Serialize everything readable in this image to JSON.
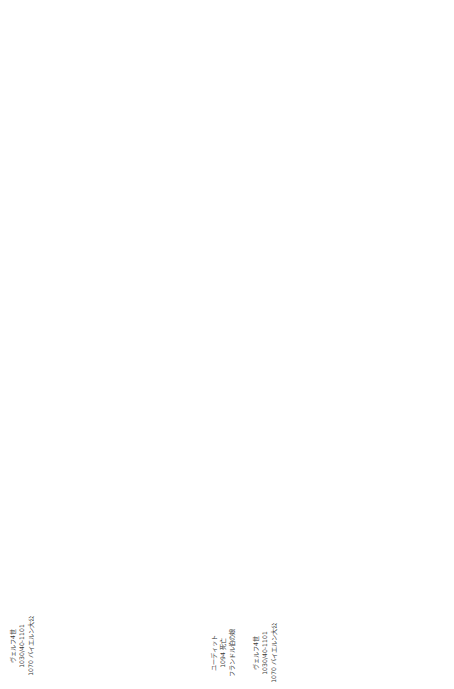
{
  "chart": {
    "title": "",
    "markers": {
      "one": "①",
      "two": "②",
      "three": "③"
    },
    "marriage_labels": {
      "first": "第一の結婚",
      "second": "第二の結婚"
    },
    "people": {
      "welf4": [
        "ヴェルフ4世",
        "1030/40-1101",
        "1070 バイエルン大公"
      ],
      "judith_fl": [
        "ユーディット",
        "1094 死亡",
        "フランドル伯の娘"
      ],
      "welf5": [
        "ヴェルフ5世",
        "ca.1073-1120",
        "1101 バイエルン大公"
      ],
      "mathilde_t": [
        "マティルデ",
        "1089 結婚、1095 離婚",
        "トスカーナ伯の娘"
      ],
      "heinrich_black": [
        "ハインリヒ黒公",
        "ca.1074-1126",
        "1120 バイエルン大公"
      ],
      "wulfhild": [
        "ヴルフヒルト",
        "1095/1100 結婚、1126 死亡",
        "ザクセン大公の娘"
      ],
      "friedrich1_st": [
        "シュタウフェンの",
        "フリードリヒ1世",
        "1105 死亡",
        "シュヴァーベン大公"
      ],
      "agnes": [
        "皇帝ハインリ",
        "ヒ4世の息女",
        "アグネス"
      ],
      "leopold3": [
        "レオポルト3世",
        "1136 死亡",
        "オーストリア辺境伯"
      ],
      "judith_w": [
        "ユーディット",
        "1100 以前、",
        "3031 死亡"
      ],
      "friedrich2_st": [
        "シュタウフェンの",
        "フリードリヒ2世",
        "ca.1110/21-47",
        "シュヴァーベン大公"
      ],
      "konrad3": [
        "国王コンラート3世",
        "1152 死亡",
        "1138 国王戴冠"
      ],
      "heinrich_jasomirgott": [
        "ヤゾミルゴットの",
        "ハインリヒ2世",
        "1107-77 死亡",
        "ライン宮中伯 1140-41",
        "オーストリア辺境伯",
        "兼バイエルン大公",
        "1141-56",
        "オーストリア大公",
        "1156-77"
      ],
      "leopold4": [
        "レオポルト4世",
        "1108 頃 -41 死亡",
        "オーストリア辺",
        "境伯 1136-41",
        "バイエルン大公",
        "1139-41"
      ],
      "otto_freising": [
        "フライジンク",
        "司教オットー",
        "1111 あるいは",
        "1114/16-58 死亡"
      ],
      "konrad_monk": [
        "コンラート",
        "シトー会修道士",
        "1126 死亡"
      ],
      "heinrich_proud": [
        "ハインリヒ傲慢公",
        "ca. 1100-39",
        "1126 バイエルン大公",
        "1137 ザクセン大公"
      ],
      "gertrud": [
        "ゲルトルート",
        "1143 死亡",
        "バイエルン大公",
        "ヤゾミルゴットの",
        "ハインリヒと再婚"
      ],
      "friedrich_barbarossa": [
        "フリードリヒ1世",
        "（バルバロッサ）",
        "ca. 1122-90",
        "1152 ドイツ国王",
        "1155 皇帝"
      ],
      "barb_wives": [
        "1. フォーブルク辺境伯の",
        "アデラ",
        "1149 頃結婚、1153 死亡",
        "2. ブルグンド伯の娘",
        "ベアトリクス",
        "1156 結婚、1184 死亡"
      ],
      "bertha": [
        "ベルタ"
      ],
      "matthaeus": [
        "ロレーヌ大公",
        "マテウス1世"
      ],
      "heinrich_lion": [
        "ハインリヒ獅子公",
        "1133/35-95",
        "1142 ザクセン大公",
        "1156 バイエルン大公"
      ],
      "lion_wives": [
        "1. ツェーリンゲンの",
        "クレメンティア",
        "1162 結婚解消",
        "2. イングランド国王",
        "ヘンリ2世の娘",
        "マティルデ",
        "ca. 1156-89",
        "3. プリースカステル伯",
        "ゴットフリートの娘"
      ]
    }
  }
}
